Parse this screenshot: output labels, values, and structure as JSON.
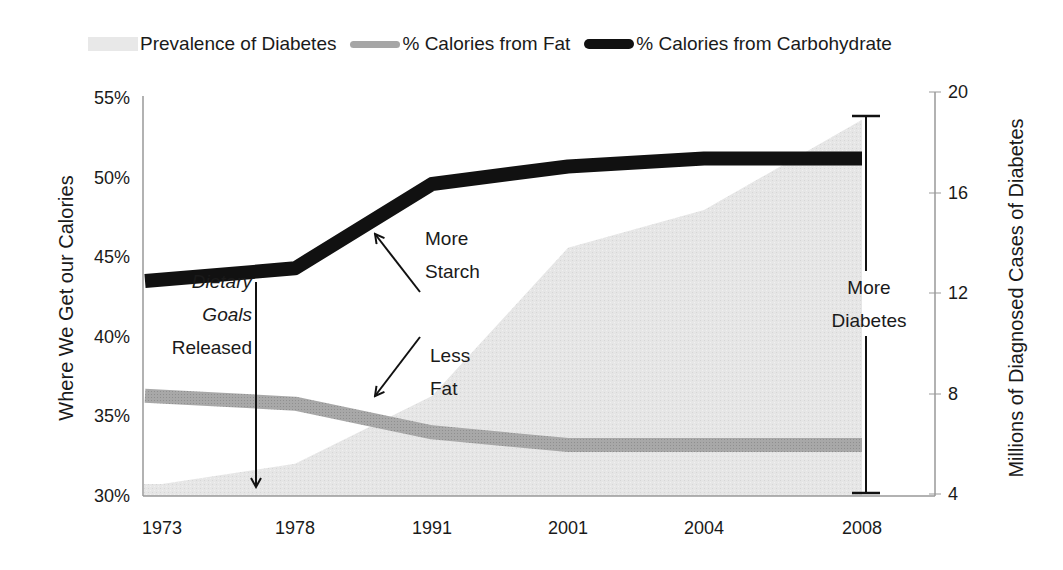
{
  "legend": {
    "diabetes": "Prevalence of Diabetes",
    "fat": "% Calories from Fat",
    "carb": "% Calories from Carbohydrate"
  },
  "axes": {
    "left_title": "Where We Get our Calories",
    "right_title": "Millions of Diagnosed Cases of Diabetes",
    "left_ticks": [
      "55%",
      "50%",
      "45%",
      "40%",
      "35%",
      "30%"
    ],
    "right_ticks": [
      "20",
      "16",
      "12",
      "8",
      "4"
    ],
    "x_ticks": [
      "1973",
      "1978",
      "1991",
      "2001",
      "2004",
      "2008"
    ]
  },
  "annotations": {
    "dietary_line1": "Dietary",
    "dietary_line2": "Goals",
    "dietary_line3": "Released",
    "starch_line1": "More",
    "starch_line2": "Starch",
    "fat_line1": "Less",
    "fat_line2": "Fat",
    "diabetes_line1": "More",
    "diabetes_line2": "Diabetes"
  },
  "colors": {
    "carb": "#111111",
    "fat": "#a6a6a6",
    "diabetes_area": "#e8e8e8",
    "axis": "#999999"
  },
  "chart_data": {
    "type": "line",
    "title": "",
    "categories": [
      "1973",
      "1978",
      "1991",
      "2001",
      "2004",
      "2008"
    ],
    "series": [
      {
        "name": "Prevalence of Diabetes",
        "type": "area",
        "axis": "right",
        "unit": "millions",
        "values": [
          4.4,
          5.2,
          7.9,
          13.8,
          15.3,
          18.9
        ]
      },
      {
        "name": "% Calories from Fat",
        "type": "line",
        "axis": "left",
        "unit": "%",
        "values": [
          36.3,
          35.8,
          34.0,
          33.2,
          33.2,
          33.2
        ]
      },
      {
        "name": "% Calories from Carbohydrate",
        "type": "line",
        "axis": "left",
        "unit": "%",
        "values": [
          43.5,
          44.3,
          49.6,
          50.7,
          51.2,
          51.2
        ]
      }
    ],
    "xlabel": "",
    "ylabel": "Where We Get our Calories",
    "y2label": "Millions of Diagnosed Cases of Diabetes",
    "ylim": [
      30,
      55
    ],
    "y2lim": [
      4,
      20
    ],
    "grid": false,
    "legend_position": "top",
    "annotations": [
      {
        "text": "Dietary Goals Released",
        "at": "1977 (down arrow)"
      },
      {
        "text": "More Starch",
        "points_to": "% Calories from Carbohydrate"
      },
      {
        "text": "Less Fat",
        "points_to": "% Calories from Fat"
      },
      {
        "text": "More Diabetes",
        "at": "2008 (range bar)"
      }
    ]
  }
}
